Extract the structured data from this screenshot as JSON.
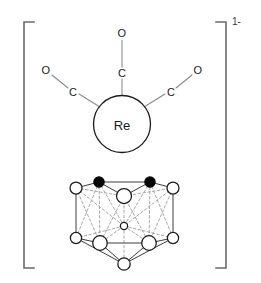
{
  "figure": {
    "charge_label": "1-",
    "metal": {
      "symbol": "Re",
      "name": "rhenium-center",
      "cx": 122,
      "cy": 124,
      "r": 28.5
    },
    "carbonyl_ligands": [
      {
        "name": "carbonyl-top",
        "carbon_label": "C",
        "oxygen_label": "O",
        "carbon": {
          "x": 122,
          "y": 73
        },
        "oxygen": {
          "x": 122,
          "y": 33
        },
        "bond_from": {
          "x": 122,
          "y": 95.5
        }
      },
      {
        "name": "carbonyl-left",
        "carbon_label": "C",
        "oxygen_label": "O",
        "carbon": {
          "x": 73,
          "y": 92
        },
        "oxygen": {
          "x": 46,
          "y": 70
        },
        "bond_from": {
          "x": 100,
          "y": 107
        }
      },
      {
        "name": "carbonyl-right",
        "carbon_label": "C",
        "oxygen_label": "O",
        "carbon": {
          "x": 171,
          "y": 92
        },
        "oxygen": {
          "x": 198,
          "y": 70
        },
        "bond_from": {
          "x": 144,
          "y": 107
        }
      }
    ],
    "cluster": {
      "name": "carborane-cage",
      "vertices": [
        {
          "id": "t1",
          "x": 76,
          "y": 188,
          "r": 6.0,
          "type": "open",
          "layer": "front"
        },
        {
          "id": "t2",
          "x": 99,
          "y": 182,
          "r": 5.2,
          "type": "filled",
          "layer": "back"
        },
        {
          "id": "t3",
          "x": 124,
          "y": 196,
          "r": 7.5,
          "type": "open",
          "layer": "front"
        },
        {
          "id": "t4",
          "x": 150,
          "y": 182,
          "r": 5.2,
          "type": "filled",
          "layer": "back"
        },
        {
          "id": "t5",
          "x": 173,
          "y": 188,
          "r": 6.0,
          "type": "open",
          "layer": "front"
        },
        {
          "id": "m1",
          "x": 124,
          "y": 226,
          "r": 3.6,
          "type": "open",
          "layer": "back"
        },
        {
          "id": "b1",
          "x": 76,
          "y": 238,
          "r": 5.6,
          "type": "open",
          "layer": "front"
        },
        {
          "id": "b2",
          "x": 100,
          "y": 243,
          "r": 7.3,
          "type": "open",
          "layer": "front"
        },
        {
          "id": "b3",
          "x": 149,
          "y": 243,
          "r": 7.3,
          "type": "open",
          "layer": "front"
        },
        {
          "id": "b4",
          "x": 173,
          "y": 238,
          "r": 5.6,
          "type": "open",
          "layer": "front"
        },
        {
          "id": "ap",
          "x": 124,
          "y": 264,
          "r": 6.2,
          "type": "open",
          "layer": "front"
        }
      ],
      "edges_front": [
        [
          "t1",
          "t2"
        ],
        [
          "t2",
          "t4"
        ],
        [
          "t4",
          "t5"
        ],
        [
          "t1",
          "b1"
        ],
        [
          "t5",
          "b4"
        ],
        [
          "b1",
          "b2"
        ],
        [
          "b2",
          "b3"
        ],
        [
          "b3",
          "b4"
        ],
        [
          "b2",
          "ap"
        ],
        [
          "b3",
          "ap"
        ],
        [
          "b1",
          "ap"
        ],
        [
          "b4",
          "ap"
        ],
        [
          "t2",
          "t3"
        ],
        [
          "t3",
          "t4"
        ]
      ],
      "edges_back": [
        [
          "t1",
          "t3"
        ],
        [
          "t3",
          "t5"
        ],
        [
          "t1",
          "b2"
        ],
        [
          "t2",
          "b1"
        ],
        [
          "t2",
          "b2"
        ],
        [
          "t5",
          "b3"
        ],
        [
          "t4",
          "b4"
        ],
        [
          "t4",
          "b3"
        ],
        [
          "t3",
          "m1"
        ],
        [
          "t2",
          "m1"
        ],
        [
          "t4",
          "m1"
        ],
        [
          "m1",
          "b1"
        ],
        [
          "m1",
          "b2"
        ],
        [
          "m1",
          "b3"
        ],
        [
          "m1",
          "b4"
        ],
        [
          "t1",
          "m1"
        ],
        [
          "t5",
          "m1"
        ],
        [
          "m1",
          "ap"
        ],
        [
          "t3",
          "b2"
        ],
        [
          "t3",
          "b3"
        ]
      ]
    },
    "brackets": {
      "left": {
        "x": 24,
        "top": 22,
        "bottom": 268,
        "tick": 10
      },
      "right": {
        "x": 226,
        "top": 22,
        "bottom": 268,
        "tick": 10
      },
      "charge_position": {
        "x": 234,
        "y": 22
      }
    },
    "colors": {
      "background": "#ffffff",
      "bracket": "#6a6a6a",
      "bond": "#8a8a8a",
      "outline": "#1a1a1a",
      "cage_front": "#3c3c3c",
      "cage_back": "#9a9a9a",
      "filled_vertex": "#050505"
    }
  }
}
